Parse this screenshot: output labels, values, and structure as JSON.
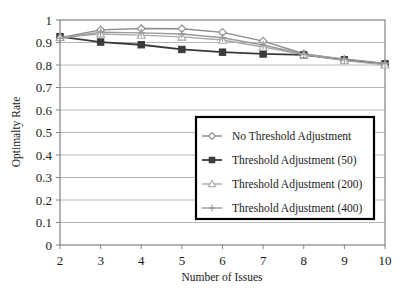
{
  "chart_data": {
    "type": "line",
    "title": "",
    "xlabel": "Number of Issues",
    "ylabel": "Optimalty Rate",
    "x": [
      2,
      3,
      4,
      5,
      6,
      7,
      8,
      9,
      10
    ],
    "xlim": [
      2,
      10
    ],
    "ylim": [
      0,
      1
    ],
    "ytick_labels": [
      "0",
      "0.1",
      "0.2",
      "0.3",
      "0.4",
      "0.5",
      "0.6",
      "0.7",
      "0.8",
      "0.9",
      "1"
    ],
    "ytick_values": [
      0,
      0.1,
      0.2,
      0.3,
      0.4,
      0.5,
      0.6,
      0.7,
      0.8,
      0.9,
      1
    ],
    "xtick_labels": [
      "2",
      "3",
      "4",
      "5",
      "6",
      "7",
      "8",
      "9",
      "10"
    ],
    "grid": "horizontal",
    "legend_position": "lower-center-right",
    "series": [
      {
        "name": "No Threshold Adjustment",
        "marker": "diamond",
        "color": "#8c8c8c",
        "values": [
          0.921,
          0.956,
          0.962,
          0.961,
          0.945,
          0.906,
          0.85,
          0.824,
          0.806
        ]
      },
      {
        "name": "Threshold Adjustment (50)",
        "marker": "square",
        "color": "#3a3a3a",
        "values": [
          0.926,
          0.902,
          0.89,
          0.869,
          0.857,
          0.849,
          0.845,
          0.823,
          0.805
        ]
      },
      {
        "name": "Threshold Adjustment (200)",
        "marker": "triangle",
        "color": "#a8a8a8",
        "values": [
          0.923,
          0.938,
          0.933,
          0.925,
          0.911,
          0.88,
          0.846,
          0.82,
          0.801
        ]
      },
      {
        "name": "Threshold Adjustment (400)",
        "marker": "cross",
        "color": "#9a9a9a",
        "values": [
          0.918,
          0.946,
          0.943,
          0.938,
          0.921,
          0.889,
          0.848,
          0.827,
          0.808
        ]
      }
    ]
  },
  "axes": {
    "y_title": "Optimalty Rate",
    "x_title": "Number of Issues"
  },
  "legend": {
    "entries": [
      {
        "label": "No Threshold Adjustment"
      },
      {
        "label": "Threshold Adjustment (50)"
      },
      {
        "label": "Threshold Adjustment (200)"
      },
      {
        "label": "Threshold Adjustment (400)"
      }
    ]
  },
  "style": {
    "plot_border": "#808080",
    "grid_color": "#b0b0b0",
    "legend_border": "#000000",
    "background": "#ffffff"
  }
}
